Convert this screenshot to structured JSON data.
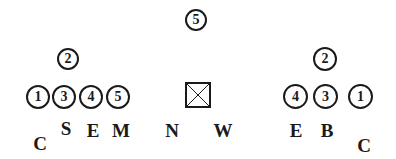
{
  "diagram": {
    "top_player": {
      "number": "5",
      "x": 196,
      "y": 20
    },
    "left_group": {
      "top": {
        "number": "2",
        "x": 68,
        "y": 59
      },
      "row": [
        {
          "number": "1",
          "x": 37,
          "y": 96
        },
        {
          "number": "3",
          "x": 64,
          "y": 96
        },
        {
          "number": "4",
          "x": 91,
          "y": 96
        },
        {
          "number": "5",
          "x": 118,
          "y": 96
        }
      ]
    },
    "center_marker": {
      "symbol": "x-box",
      "x": 198,
      "y": 95
    },
    "right_group": {
      "top": {
        "number": "2",
        "x": 325,
        "y": 59
      },
      "row": [
        {
          "number": "4",
          "x": 295,
          "y": 96
        },
        {
          "number": "3",
          "x": 325,
          "y": 96
        },
        {
          "number": "1",
          "x": 360,
          "y": 96
        }
      ]
    },
    "labels": [
      {
        "text": "C",
        "x": 40,
        "y": 143
      },
      {
        "text": "S",
        "x": 66,
        "y": 128
      },
      {
        "text": "E",
        "x": 93,
        "y": 130
      },
      {
        "text": "M",
        "x": 121,
        "y": 130
      },
      {
        "text": "N",
        "x": 172,
        "y": 130
      },
      {
        "text": "W",
        "x": 223,
        "y": 130
      },
      {
        "text": "E",
        "x": 296,
        "y": 130
      },
      {
        "text": "B",
        "x": 327,
        "y": 130
      },
      {
        "text": "C",
        "x": 364,
        "y": 145
      }
    ]
  }
}
